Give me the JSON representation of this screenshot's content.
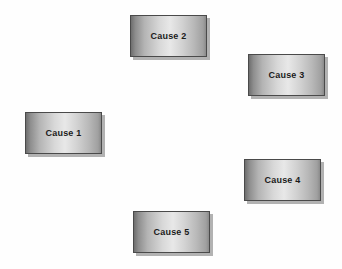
{
  "diagram": {
    "background_color": "#fefefe",
    "box_style": {
      "border_color": "#4a4a4a",
      "gradient_start": "#6e6e6e",
      "gradient_mid": "#e8e8e8",
      "gradient_end": "#8a8a8a",
      "shadow_color": "#828282",
      "text_color": "#1b1b1b"
    },
    "nodes": [
      {
        "id": "cause-1",
        "label": "Cause 1",
        "x": 25,
        "y": 112,
        "width": 77,
        "height": 42
      },
      {
        "id": "cause-2",
        "label": "Cause 2",
        "x": 130,
        "y": 15,
        "width": 77,
        "height": 42
      },
      {
        "id": "cause-3",
        "label": "Cause 3",
        "x": 248,
        "y": 54,
        "width": 77,
        "height": 42
      },
      {
        "id": "cause-4",
        "label": "Cause 4",
        "x": 244,
        "y": 159,
        "width": 77,
        "height": 42
      },
      {
        "id": "cause-5",
        "label": "Cause 5",
        "x": 133,
        "y": 211,
        "width": 77,
        "height": 42
      }
    ]
  }
}
